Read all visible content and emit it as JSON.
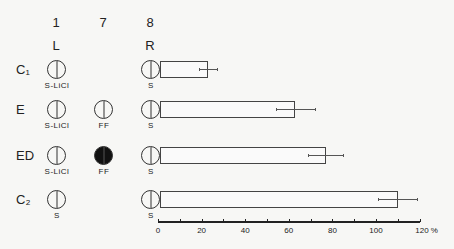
{
  "columns": [
    {
      "number": "1",
      "side": "L"
    },
    {
      "number": "7",
      "side": ""
    },
    {
      "number": "8",
      "side": "R"
    }
  ],
  "rows": [
    {
      "label": "C₁",
      "cells": [
        {
          "filled": false,
          "sub": "S-LiCl"
        },
        null,
        {
          "filled": false,
          "sub": "S"
        }
      ]
    },
    {
      "label": "E",
      "cells": [
        {
          "filled": false,
          "sub": "S-LiCl"
        },
        {
          "filled": false,
          "sub": "FF"
        },
        {
          "filled": false,
          "sub": "S"
        }
      ]
    },
    {
      "label": "ED",
      "cells": [
        {
          "filled": false,
          "sub": "S-LiCl"
        },
        {
          "filled": true,
          "sub": "FF"
        },
        {
          "filled": false,
          "sub": "S"
        }
      ]
    },
    {
      "label": "C₂",
      "cells": [
        {
          "filled": false,
          "sub": "S"
        },
        null,
        {
          "filled": false,
          "sub": "S"
        }
      ]
    }
  ],
  "chart_data": {
    "type": "bar",
    "orientation": "horizontal",
    "categories": [
      "C1",
      "E",
      "ED",
      "C2"
    ],
    "values": [
      23,
      63,
      77,
      110
    ],
    "errors": [
      4,
      9,
      8,
      9
    ],
    "title": "",
    "xlabel": "%",
    "ylabel": "",
    "xlim": [
      0,
      120
    ],
    "xticks": [
      0,
      20,
      40,
      60,
      80,
      100,
      120
    ],
    "xtick_labels": [
      "0",
      "20",
      "40",
      "60",
      "80",
      "100",
      "120 %"
    ],
    "grid": false,
    "legend": null
  }
}
